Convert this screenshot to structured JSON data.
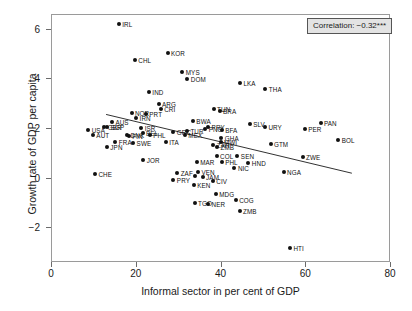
{
  "chart_data": {
    "type": "scatter",
    "title": "",
    "xlabel": "Informal sector in per cent of GDP",
    "ylabel": "Growth rate of GDP per capita",
    "xlim": [
      0,
      80
    ],
    "ylim": [
      -3.4,
      6.6
    ],
    "xticks": [
      0,
      20,
      40,
      60,
      80
    ],
    "yticks": [
      -2,
      0,
      2,
      4,
      6
    ],
    "grid": false,
    "legend": "none",
    "annotation": "Correlation: −0.32***",
    "trendline": {
      "x0": 13.0,
      "y0": 2.55,
      "x1": 71.0,
      "y1": 0.18
    },
    "points": [
      {
        "label": "IRL",
        "x": 16.0,
        "y": 6.18
      },
      {
        "label": "KOR",
        "x": 27.5,
        "y": 5.02
      },
      {
        "label": "CHL",
        "x": 19.8,
        "y": 4.73
      },
      {
        "label": "MYS",
        "x": 31.0,
        "y": 4.27
      },
      {
        "label": "DOM",
        "x": 32.2,
        "y": 3.98
      },
      {
        "label": "LKA",
        "x": 44.6,
        "y": 3.82
      },
      {
        "label": "THA",
        "x": 50.6,
        "y": 3.58
      },
      {
        "label": "IND",
        "x": 23.1,
        "y": 3.44
      },
      {
        "label": "ARG",
        "x": 25.4,
        "y": 2.98
      },
      {
        "label": "CRI",
        "x": 25.9,
        "y": 2.78
      },
      {
        "label": "TUN",
        "x": 38.4,
        "y": 2.78
      },
      {
        "label": "BRA",
        "x": 39.8,
        "y": 2.7
      },
      {
        "label": "NOR",
        "x": 19.0,
        "y": 2.62
      },
      {
        "label": "PRT",
        "x": 22.4,
        "y": 2.58
      },
      {
        "label": "IRN",
        "x": 20.1,
        "y": 2.42
      },
      {
        "label": "PAN",
        "x": 63.6,
        "y": 2.22
      },
      {
        "label": "BWA",
        "x": 33.5,
        "y": 2.3
      },
      {
        "label": "SLV",
        "x": 46.9,
        "y": 2.16
      },
      {
        "label": "URY",
        "x": 50.5,
        "y": 2.06
      },
      {
        "label": "AUS",
        "x": 14.4,
        "y": 2.26
      },
      {
        "label": "PER",
        "x": 59.9,
        "y": 1.98
      },
      {
        "label": "PRY",
        "x": 37.1,
        "y": 2.06
      },
      {
        "label": "PNG",
        "x": 36.4,
        "y": 1.96
      },
      {
        "label": "BFA",
        "x": 40.3,
        "y": 1.94
      },
      {
        "label": "USA",
        "x": 8.8,
        "y": 1.94
      },
      {
        "label": "GBR",
        "x": 12.6,
        "y": 2.04
      },
      {
        "label": "SGP",
        "x": 13.3,
        "y": 2.06
      },
      {
        "label": "ISR",
        "x": 21.3,
        "y": 2.0
      },
      {
        "label": "GRC",
        "x": 28.9,
        "y": 1.86
      },
      {
        "label": "TUR",
        "x": 32.1,
        "y": 1.88
      },
      {
        "label": "AUT",
        "x": 9.9,
        "y": 1.74
      },
      {
        "label": "DNK",
        "x": 18.0,
        "y": 1.74
      },
      {
        "label": "FIN",
        "x": 18.4,
        "y": 1.7
      },
      {
        "label": "PHL",
        "x": 23.3,
        "y": 1.72
      },
      {
        "label": "BEL",
        "x": 21.6,
        "y": 1.8
      },
      {
        "label": "MEX",
        "x": 31.6,
        "y": 1.72
      },
      {
        "label": "GHA",
        "x": 40.2,
        "y": 1.62
      },
      {
        "label": "BOL",
        "x": 67.8,
        "y": 1.5
      },
      {
        "label": "FRA",
        "x": 15.2,
        "y": 1.42
      },
      {
        "label": "SWE",
        "x": 19.4,
        "y": 1.4
      },
      {
        "label": "ITA",
        "x": 27.1,
        "y": 1.42
      },
      {
        "label": "MWI",
        "x": 40.0,
        "y": 1.42
      },
      {
        "label": "ZAR",
        "x": 38.3,
        "y": 1.3
      },
      {
        "label": "ZMB",
        "x": 39.2,
        "y": 1.22
      },
      {
        "label": "GTM",
        "x": 51.8,
        "y": 1.34
      },
      {
        "label": "JPN",
        "x": 13.2,
        "y": 1.22
      },
      {
        "label": "COL",
        "x": 39.1,
        "y": 0.86
      },
      {
        "label": "SEN",
        "x": 44.0,
        "y": 0.86
      },
      {
        "label": "ZWE",
        "x": 59.4,
        "y": 0.82
      },
      {
        "label": "JOR",
        "x": 21.8,
        "y": 0.7
      },
      {
        "label": "MAR",
        "x": 34.4,
        "y": 0.64
      },
      {
        "label": "PHL2",
        "x": 40.3,
        "y": 0.62
      },
      {
        "label": "HND",
        "x": 46.6,
        "y": 0.58
      },
      {
        "label": "NIC",
        "x": 43.3,
        "y": 0.38
      },
      {
        "label": "CHE",
        "x": 10.4,
        "y": 0.16
      },
      {
        "label": "ZAF",
        "x": 29.8,
        "y": 0.2
      },
      {
        "label": "VEN",
        "x": 34.7,
        "y": 0.22
      },
      {
        "label": "NGA",
        "x": 54.9,
        "y": 0.22
      },
      {
        "label": "JAM2",
        "x": 34.0,
        "y": 0.06
      },
      {
        "label": "JAM",
        "x": 35.8,
        "y": 0.04
      },
      {
        "label": "CIV",
        "x": 38.2,
        "y": -0.12
      },
      {
        "label": "PRY2",
        "x": 28.9,
        "y": -0.1
      },
      {
        "label": "KEN",
        "x": 33.7,
        "y": -0.3
      },
      {
        "label": "MDG",
        "x": 38.9,
        "y": -0.66
      },
      {
        "label": "TGO",
        "x": 33.9,
        "y": -1.02
      },
      {
        "label": "NER",
        "x": 37.1,
        "y": -1.06
      },
      {
        "label": "COG",
        "x": 43.6,
        "y": -0.92
      },
      {
        "label": "ZMB2",
        "x": 44.5,
        "y": -1.34
      },
      {
        "label": "HTI",
        "x": 56.4,
        "y": -2.82
      }
    ],
    "point_label_text": {
      "PHL2": "PHL",
      "JAM2": "",
      "PRY2": "PRY",
      "ZMB2": "ZMB",
      "ZAR": "ZAR",
      "ZMB": "ZMB"
    }
  }
}
